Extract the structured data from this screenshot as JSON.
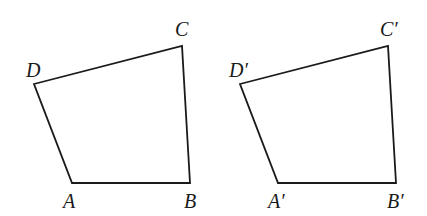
{
  "figure": {
    "stroke_color": "#1a1a1a",
    "background": "#ffffff"
  },
  "quadrilaterals": [
    {
      "name": "ABCD",
      "vertices": {
        "A": {
          "label": "A",
          "x": 72,
          "y": 183
        },
        "B": {
          "label": "B",
          "x": 190,
          "y": 183
        },
        "C": {
          "label": "C",
          "x": 182,
          "y": 46
        },
        "D": {
          "label": "D",
          "x": 34,
          "y": 84
        }
      }
    },
    {
      "name": "A'B'C'D'",
      "vertices": {
        "A": {
          "label": "A′",
          "x": 278,
          "y": 183
        },
        "B": {
          "label": "B′",
          "x": 396,
          "y": 183
        },
        "C": {
          "label": "C′",
          "x": 388,
          "y": 46
        },
        "D": {
          "label": "D′",
          "x": 240,
          "y": 84
        }
      }
    }
  ]
}
